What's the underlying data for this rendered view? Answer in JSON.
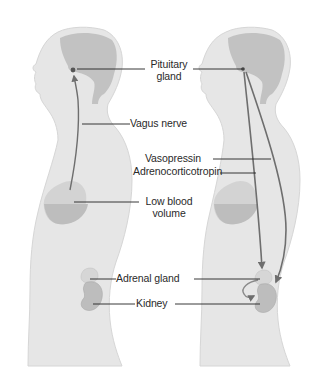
{
  "diagram": {
    "title": "",
    "figures": [
      {
        "id": "left-figure",
        "description": "Side profile silhouette with brain, vagus nerve pathway from heart to pituitary"
      },
      {
        "id": "right-figure",
        "description": "Side profile silhouette with hormone pathways from pituitary to adrenal gland and kidney"
      }
    ],
    "labels": {
      "pituitary_line1": "Pituitary",
      "pituitary_line2": "gland",
      "vagus": "Vagus nerve",
      "vasopressin": "Vasopressin",
      "acth": "Adrenocorticotropin",
      "low_blood_line1": "Low blood",
      "low_blood_line2": "volume",
      "adrenal": "Adrenal gland",
      "kidney": "Kidney"
    },
    "colors": {
      "body": "#e6e6e6",
      "body_edge": "#d4d4d4",
      "brain": "#c2c2c2",
      "organ": "#bdbdbd",
      "organ_light": "#d3d3d3",
      "arrow": "#6e6e6e",
      "leader": "#222222",
      "text": "#2a2a2a"
    },
    "pathways": [
      {
        "from": "Low blood volume",
        "to": "Pituitary gland",
        "via": "Vagus nerve"
      },
      {
        "from": "Pituitary gland",
        "to": "Kidney",
        "via": "Vasopressin"
      },
      {
        "from": "Pituitary gland",
        "to": "Adrenal gland",
        "via": "Adrenocorticotropin"
      },
      {
        "from": "Adrenal gland",
        "to": "Kidney",
        "via": "local curved arrow"
      }
    ]
  }
}
